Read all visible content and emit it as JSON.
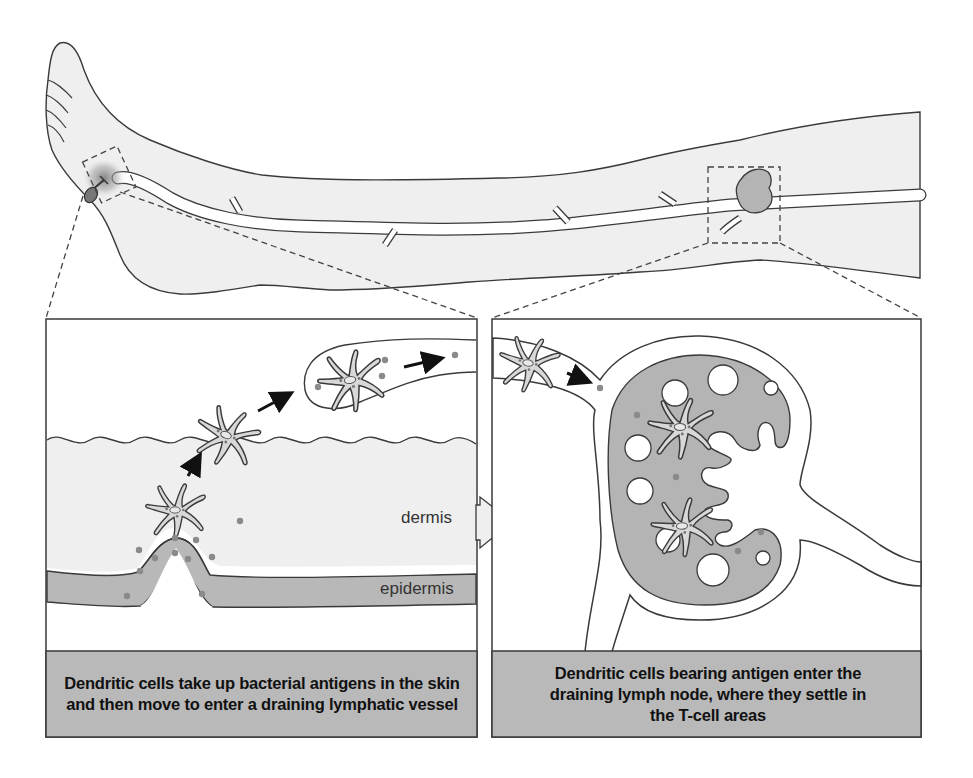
{
  "figure": {
    "colors": {
      "skin_fill": "#efefef",
      "outline": "#3a3a3a",
      "lymph_node_fill": "#b4b4b4",
      "epidermis_fill": "#b8b8b8",
      "caption_fill": "#b9b9b9",
      "antigen_dot": "#8a8a8a",
      "background": "#ffffff"
    },
    "top_illustration": {
      "subject": "leg with foot wound and lymphatic vessel leading to lymph node in the thigh",
      "icons": [
        "thorn-wound-icon",
        "lymph-node-icon",
        "lymphatic-vessel-icon"
      ]
    },
    "left_panel": {
      "labels": {
        "dermis": "dermis",
        "epidermis": "epidermis"
      },
      "caption": "Dendritic cells take up bacterial antigens in the skin and then move to enter a draining lymphatic vessel"
    },
    "right_panel": {
      "caption": "Dendritic cells bearing antigen enter the draining lymph node, where they settle in the T-cell areas"
    }
  }
}
